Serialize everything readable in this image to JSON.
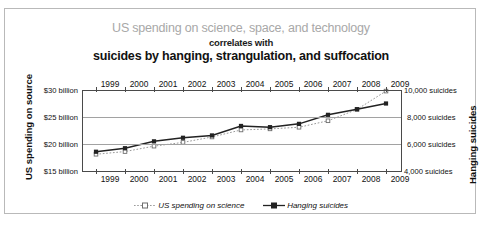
{
  "title": {
    "line1": "US spending on science, space, and technology",
    "line2": "correlates with",
    "line3": "suicides by hanging, strangulation, and suffocation"
  },
  "axis": {
    "left_title": "US spending on source",
    "right_title": "Hanging suicides",
    "left_ticks": [
      "$30 billion",
      "$25 billion",
      "$20 billion",
      "$15 billion"
    ],
    "right_ticks": [
      "10,000 suicides",
      "8,000 suicides",
      "6,000 suicides",
      "4,000 suicides"
    ]
  },
  "legend": {
    "series1": "US spending on science",
    "series2": "Hanging suicides"
  },
  "colors": {
    "title_top": "#a8a8a8",
    "title_bottom": "#111111",
    "spending_line": "#9a9a9a",
    "suicide_line": "#222222",
    "gridline": "#a2a2a2",
    "axis": "#4a4a4a",
    "frame": "#b9b9b9"
  },
  "chart_data": {
    "type": "line",
    "title": "US spending on science, space, and technology correlates with suicides by hanging, strangulation, and suffocation",
    "xlabel": "",
    "ylabel": "US spending on source",
    "y2label": "Hanging suicides",
    "grid": true,
    "legend_position": "bottom",
    "categories": [
      1999,
      2000,
      2001,
      2002,
      2003,
      2004,
      2005,
      2006,
      2007,
      2008,
      2009
    ],
    "x_tick_labels": [
      "1999",
      "2000",
      "2001",
      "2002",
      "2003",
      "2004",
      "2005",
      "2006",
      "2007",
      "2008",
      "2009"
    ],
    "x_axis_duplicated_top_and_bottom": true,
    "ylim": [
      15,
      30
    ],
    "y_ticks": [
      15,
      20,
      25,
      30
    ],
    "y_tick_labels": [
      "$15 billion",
      "$20 billion",
      "$25 billion",
      "$30 billion"
    ],
    "y2lim": [
      4000,
      10000
    ],
    "y2_ticks": [
      4000,
      6000,
      8000,
      10000
    ],
    "y2_tick_labels": [
      "4,000 suicides",
      "6,000 suicides",
      "8,000 suicides",
      "10,000 suicides"
    ],
    "series": [
      {
        "name": "US spending on science",
        "axis": "left",
        "unit": "billion USD",
        "style": "dotted",
        "color": "#9a9a9a",
        "marker": "square-open",
        "values": [
          18.1,
          18.6,
          19.6,
          20.3,
          21.3,
          22.6,
          22.8,
          23.1,
          24.3,
          26.4,
          29.8
        ]
      },
      {
        "name": "Hanging suicides",
        "axis": "right",
        "unit": "suicides",
        "style": "solid",
        "color": "#222222",
        "marker": "square-filled",
        "values": [
          5427,
          5688,
          6198,
          6462,
          6635,
          7336,
          7248,
          7491,
          8161,
          8578,
          9000
        ]
      }
    ]
  }
}
